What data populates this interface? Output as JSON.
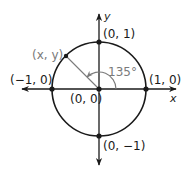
{
  "diagram": {
    "center": {
      "x": 99,
      "y": 89
    },
    "radius": 47,
    "angle_deg": 135,
    "colors": {
      "ink": "#1a1a1a",
      "gray": "#7a7a7a",
      "background": "#ffffff"
    },
    "axes": {
      "x_label": "x",
      "y_label": "y",
      "x_range_px": [
        21,
        176
      ],
      "y_range_px": [
        13,
        165
      ]
    },
    "points": [
      {
        "id": "origin",
        "label": "(0, 0)"
      },
      {
        "id": "pos-x",
        "label": "(1, 0)"
      },
      {
        "id": "neg-x",
        "label": "(−1, 0)"
      },
      {
        "id": "pos-y",
        "label": "(0, 1)"
      },
      {
        "id": "neg-y",
        "label": "(0, −1)"
      },
      {
        "id": "terminal",
        "label": "(x, y)"
      }
    ],
    "angle_label": "135°"
  }
}
